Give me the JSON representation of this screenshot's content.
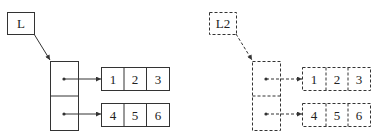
{
  "diagram": {
    "left": {
      "label": "L",
      "style": "solid",
      "rows": [
        {
          "values": [
            "1",
            "2",
            "3"
          ]
        },
        {
          "values": [
            "4",
            "5",
            "6"
          ]
        }
      ]
    },
    "right": {
      "label": "L2",
      "style": "dashed",
      "rows": [
        {
          "values": [
            "1",
            "2",
            "3"
          ]
        },
        {
          "values": [
            "4",
            "5",
            "6"
          ]
        }
      ]
    },
    "colors": {
      "stroke": "#333333",
      "text": "#222222",
      "background": "#ffffff"
    }
  }
}
